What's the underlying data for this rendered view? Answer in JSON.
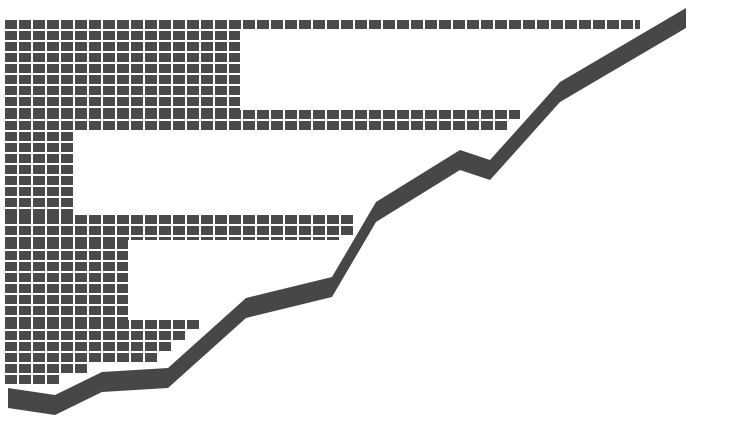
{
  "chart_data": {
    "type": "bar",
    "title": "",
    "xlabel": "",
    "ylabel": "",
    "style": "pictogram grid of square cells with overlaid rising trend band",
    "colors": {
      "cell": "#4a4a4a",
      "gap": "#ffffff",
      "band": "#474747",
      "background": "#ffffff"
    },
    "grid": {
      "origin_x": 5,
      "cell_pitch_x": 14,
      "cell_pitch_y": 11,
      "gap": 2
    },
    "bars": [
      {
        "label": "step-1",
        "x0": 5,
        "x1": 640,
        "y0": 20,
        "y1": 31
      },
      {
        "label": "step-2",
        "x0": 5,
        "x1": 240,
        "y0": 31,
        "y1": 110
      },
      {
        "label": "step-3",
        "x0": 5,
        "x1": 520,
        "y0": 110,
        "y1": 132
      },
      {
        "label": "step-4",
        "x0": 5,
        "x1": 75,
        "y0": 132,
        "y1": 215
      },
      {
        "label": "step-5",
        "x0": 5,
        "x1": 362,
        "y0": 215,
        "y1": 240
      },
      {
        "label": "step-6",
        "x0": 5,
        "x1": 128,
        "y0": 240,
        "y1": 320
      },
      {
        "label": "step-7",
        "x0": 5,
        "x1": 222,
        "y0": 320,
        "y1": 400
      }
    ],
    "trend_band": {
      "thickness": 20,
      "points": [
        [
          8,
          398
        ],
        [
          55,
          405
        ],
        [
          102,
          382
        ],
        [
          168,
          378
        ],
        [
          246,
          308
        ],
        [
          332,
          287
        ],
        [
          376,
          212
        ],
        [
          460,
          160
        ],
        [
          490,
          170
        ],
        [
          560,
          92
        ],
        [
          686,
          18
        ]
      ]
    },
    "top_caption": "",
    "grid_on": true,
    "legend": null
  }
}
